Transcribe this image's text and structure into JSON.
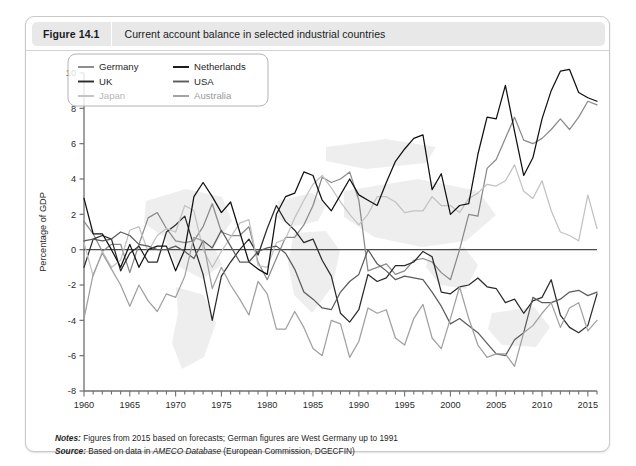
{
  "figure": {
    "number": "Figure 14.1",
    "title": "Current account balance in selected industrial countries"
  },
  "notes": {
    "notes_label": "Notes:",
    "notes_text": " Figures from 2015 based on forecasts; German figures are West Germany up to 1991",
    "source_label": "Source:",
    "source_pre": " Based on data in ",
    "source_em": "AMECO Database",
    "source_post": " (European Commission, DGECFIN)"
  },
  "colors": {
    "germany": "#8a8a8a",
    "uk": "#2b2b2b",
    "japan": "#c2c2c2",
    "netherlands": "#111111",
    "usa": "#5c5c5c",
    "australia": "#a0a0a0",
    "axis": "#6f6f6f",
    "zero_line": "#4a4a4a",
    "frame": "#c9c9c9",
    "header_bg": "#e8e8e8"
  },
  "chart_data": {
    "type": "line",
    "title": "Current account balance in selected industrial countries",
    "xlabel": "",
    "ylabel": "Percentage of GDP",
    "xlim": [
      1960,
      2016
    ],
    "ylim": [
      -8,
      10
    ],
    "yticks": [
      -8,
      -6,
      -4,
      -2,
      0,
      2,
      4,
      6,
      8,
      10
    ],
    "xticks": [
      1960,
      1965,
      1970,
      1975,
      1980,
      1985,
      1990,
      1995,
      2000,
      2005,
      2010,
      2015
    ],
    "xtick_minor_step": 1,
    "grid": false,
    "zero_line": true,
    "legend_position": "top-left",
    "x": [
      1960,
      1961,
      1962,
      1963,
      1964,
      1965,
      1966,
      1967,
      1968,
      1969,
      1970,
      1971,
      1972,
      1973,
      1974,
      1975,
      1976,
      1977,
      1978,
      1979,
      1980,
      1981,
      1982,
      1983,
      1984,
      1985,
      1986,
      1987,
      1988,
      1989,
      1990,
      1991,
      1992,
      1993,
      1994,
      1995,
      1996,
      1997,
      1998,
      1999,
      2000,
      2001,
      2002,
      2003,
      2004,
      2005,
      2006,
      2007,
      2008,
      2009,
      2010,
      2011,
      2012,
      2013,
      2014,
      2015,
      2016
    ],
    "series": [
      {
        "name": "Germany",
        "color": "#8a8a8a",
        "values": [
          1.6,
          0.9,
          -0.1,
          0.3,
          0.3,
          -1.3,
          0.3,
          1.8,
          2.1,
          1.2,
          0.5,
          0.4,
          0.5,
          1.3,
          2.6,
          1.0,
          0.8,
          0.8,
          1.3,
          -0.7,
          -1.7,
          -0.5,
          0.7,
          0.7,
          1.4,
          2.5,
          4.1,
          3.8,
          4.0,
          4.4,
          2.8,
          -1.2,
          -1.0,
          -0.8,
          -1.4,
          -1.2,
          -0.6,
          -0.5,
          -0.7,
          -1.3,
          -1.7,
          0.0,
          2.0,
          1.9,
          4.6,
          5.1,
          6.3,
          7.5,
          6.2,
          6.0,
          6.3,
          6.8,
          7.4,
          6.8,
          7.5,
          8.4,
          8.2
        ]
      },
      {
        "name": "UK",
        "color": "#2b2b2b",
        "values": [
          -1.0,
          0.6,
          0.8,
          0.6,
          -1.2,
          -0.2,
          0.2,
          -0.7,
          -0.7,
          1.0,
          1.4,
          1.9,
          0.2,
          -1.4,
          -4.0,
          -1.5,
          -0.7,
          0.0,
          0.6,
          -0.3,
          1.2,
          2.5,
          1.6,
          1.1,
          0.4,
          0.6,
          -0.6,
          -1.5,
          -3.6,
          -4.1,
          -3.4,
          -1.4,
          -1.8,
          -1.6,
          -0.9,
          -0.9,
          -0.7,
          -0.1,
          -0.4,
          -2.4,
          -2.5,
          -2.1,
          -2.0,
          -1.6,
          -2.1,
          -2.2,
          -3.0,
          -2.8,
          -3.6,
          -2.9,
          -2.7,
          -1.7,
          -3.7,
          -4.4,
          -4.7,
          -4.3,
          -2.5
        ]
      },
      {
        "name": "Japan",
        "color": "#c2c2c2",
        "values": [
          0.4,
          -1.5,
          -0.1,
          -1.0,
          -0.6,
          1.1,
          1.3,
          -0.1,
          0.8,
          1.2,
          1.0,
          2.5,
          2.2,
          0.0,
          -1.0,
          -0.1,
          0.7,
          1.5,
          1.7,
          -0.9,
          -1.0,
          0.4,
          0.6,
          1.8,
          2.8,
          3.7,
          4.2,
          3.5,
          2.7,
          2.0,
          1.4,
          2.0,
          3.0,
          3.0,
          2.7,
          2.1,
          2.2,
          2.2,
          3.0,
          2.5,
          2.5,
          2.1,
          2.9,
          3.2,
          3.7,
          3.6,
          3.9,
          4.8,
          3.3,
          2.9,
          3.9,
          2.2,
          1.0,
          0.8,
          0.5,
          3.1,
          1.2
        ]
      },
      {
        "name": "Netherlands",
        "color": "#111111",
        "values": [
          2.9,
          0.9,
          0.9,
          0.0,
          -1.0,
          0.3,
          -1.0,
          0.0,
          0.2,
          0.2,
          -1.2,
          0.0,
          3.0,
          3.8,
          3.0,
          2.1,
          2.7,
          1.0,
          -0.7,
          -1.1,
          -1.4,
          2.0,
          3.0,
          3.2,
          4.4,
          4.2,
          2.8,
          2.2,
          3.1,
          4.0,
          3.1,
          2.8,
          2.5,
          3.8,
          5.0,
          5.7,
          6.3,
          6.5,
          3.4,
          4.3,
          2.0,
          2.5,
          2.6,
          5.4,
          7.5,
          7.4,
          9.3,
          6.7,
          4.2,
          5.2,
          7.4,
          9.0,
          10.1,
          10.2,
          8.9,
          8.6,
          8.4
        ]
      },
      {
        "name": "USA",
        "color": "#5c5c5c",
        "values": [
          0.5,
          0.6,
          0.5,
          0.6,
          1.0,
          0.8,
          0.3,
          0.2,
          0.0,
          0.0,
          0.2,
          -0.1,
          -0.5,
          0.5,
          0.1,
          1.1,
          0.2,
          -0.7,
          -0.7,
          -0.1,
          0.1,
          0.2,
          -0.2,
          -1.1,
          -2.4,
          -2.8,
          -3.3,
          -3.4,
          -2.4,
          -1.8,
          -1.4,
          0.0,
          -0.8,
          -1.2,
          -1.7,
          -1.5,
          -1.6,
          -1.7,
          -2.4,
          -3.2,
          -4.2,
          -3.9,
          -4.3,
          -4.7,
          -5.3,
          -5.9,
          -6.0,
          -5.1,
          -4.7,
          -2.7,
          -3.0,
          -3.0,
          -2.8,
          -2.4,
          -2.3,
          -2.6,
          -2.4
        ]
      },
      {
        "name": "Australia",
        "color": "#a0a0a0",
        "values": [
          -3.9,
          -1.4,
          -0.2,
          -1.1,
          -2.0,
          -3.2,
          -2.0,
          -2.9,
          -3.5,
          -2.5,
          -2.7,
          -1.5,
          0.7,
          0.5,
          -2.2,
          -1.0,
          -2.0,
          -2.8,
          -3.7,
          -1.8,
          -2.5,
          -4.5,
          -4.5,
          -3.5,
          -4.4,
          -5.6,
          -6.0,
          -4.0,
          -4.2,
          -6.1,
          -5.2,
          -3.3,
          -3.6,
          -3.4,
          -5.0,
          -5.4,
          -3.9,
          -3.1,
          -5.0,
          -5.6,
          -3.9,
          -2.1,
          -3.9,
          -5.4,
          -6.1,
          -5.9,
          -5.9,
          -6.6,
          -4.7,
          -4.3,
          -3.6,
          -3.0,
          -4.4,
          -3.3,
          -3.0,
          -4.6,
          -4.0
        ]
      }
    ]
  },
  "legend": {
    "entries": [
      {
        "label": "Germany",
        "color": "#8a8a8a"
      },
      {
        "label": "Netherlands",
        "color": "#111111"
      },
      {
        "label": "UK",
        "color": "#2b2b2b"
      },
      {
        "label": "USA",
        "color": "#5c5c5c"
      },
      {
        "label": "Japan",
        "color": "#c2c2c2"
      },
      {
        "label": "Australia",
        "color": "#a0a0a0"
      }
    ]
  }
}
